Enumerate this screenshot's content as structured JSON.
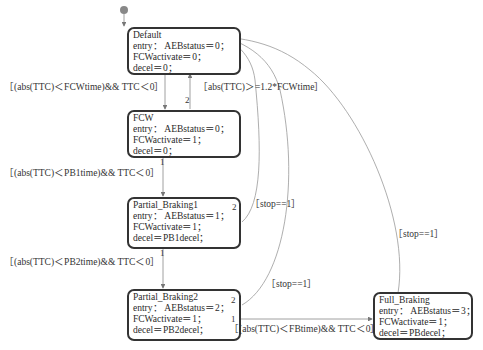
{
  "diagram": {
    "type": "stateflow-chart",
    "states": [
      {
        "id": "default",
        "name": "Default",
        "entry": "entry：  AEBstatus＝0；",
        "lines": [
          "FCWactivate＝0；",
          "decel＝0；"
        ]
      },
      {
        "id": "fcw",
        "name": "FCW",
        "entry": "entry：  AEBstatus＝0；",
        "lines": [
          "FCWactivate＝1；",
          "decel＝0；"
        ]
      },
      {
        "id": "pb1",
        "name": "Partial_Braking1",
        "entry": "entry：  AEBstatus＝1；",
        "lines": [
          "FCWactivate＝1；",
          "decel＝PB1decel；"
        ]
      },
      {
        "id": "pb2",
        "name": "Partial_Braking2",
        "entry": "entry：  AEBstatus＝2；",
        "lines": [
          "FCWactivate＝1；",
          "decel＝PB2decel；"
        ]
      },
      {
        "id": "fb",
        "name": "Full_Braking",
        "entry": "entry：  AEBstatus＝3；",
        "lines": [
          "FCWactivate＝1；",
          "decel＝PBdecel；"
        ]
      }
    ],
    "transitions": [
      {
        "from": "default",
        "to": "fcw",
        "guard": "［(abs(TTC)＜FCWtime)&& TTC＜0］",
        "priority": ""
      },
      {
        "from": "fcw",
        "to": "default",
        "guard": "［abs(TTC)＞=1.2*FCWtime］",
        "priority": "2"
      },
      {
        "from": "fcw",
        "to": "pb1",
        "guard": "［(abs(TTC)＜PB1time)&& TTC＜0］",
        "priority": "1"
      },
      {
        "from": "pb1",
        "to": "default",
        "guard": "［stop==1］",
        "priority": "2"
      },
      {
        "from": "pb1",
        "to": "pb2",
        "guard": "［(abs(TTC)＜PB2time)&& TTC＜0］",
        "priority": "1"
      },
      {
        "from": "pb2",
        "to": "default",
        "guard": "［stop==1］",
        "priority": "2"
      },
      {
        "from": "pb2",
        "to": "fb",
        "guard": "［(abs(TTC)＜FBtime)&& TTC＜0］",
        "priority": "1"
      },
      {
        "from": "fb",
        "to": "default",
        "guard": "［stop==1］",
        "priority": ""
      }
    ],
    "colors": {
      "state_border": "#333333",
      "wire": "#888888",
      "initial_dot": "#888888"
    }
  }
}
